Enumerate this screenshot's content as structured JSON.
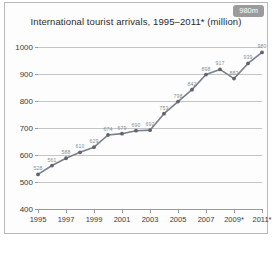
{
  "chart_data": {
    "type": "line",
    "title": "International tourist arrivals, 1995–2011* (million)",
    "xlabel": "",
    "ylabel": "",
    "ylim": [
      400,
      1000
    ],
    "yticks": [
      400,
      500,
      600,
      700,
      800,
      900,
      1000
    ],
    "grid": true,
    "legend": "none",
    "x": [
      1995,
      1996,
      1997,
      1998,
      1999,
      2000,
      2001,
      2002,
      2003,
      2004,
      2005,
      2006,
      2007,
      2008,
      2009,
      2010,
      2011
    ],
    "xtick_labels": [
      "1995",
      "1997",
      "1999",
      "2001",
      "2003",
      "2005",
      "2007",
      "2009*",
      "2011*"
    ],
    "xtick_values": [
      1995,
      1997,
      1999,
      2001,
      2003,
      2005,
      2007,
      2009,
      2011
    ],
    "values": [
      528,
      561,
      588,
      610,
      629,
      674,
      679,
      690,
      692,
      753,
      798,
      842,
      898,
      917,
      883,
      939,
      980
    ],
    "point_labels": [
      "528",
      "561",
      "588",
      "610",
      "629",
      "674",
      "679",
      "690",
      "692",
      "753",
      "798",
      "842",
      "898",
      "917",
      "883",
      "939",
      "980"
    ],
    "annotation_badge": "980m",
    "series_color": "#7a7f8a",
    "marker_color": "#5f646e",
    "grid_color": "#c4c4c4",
    "label_color": "#8d8d8d"
  },
  "caption": ""
}
